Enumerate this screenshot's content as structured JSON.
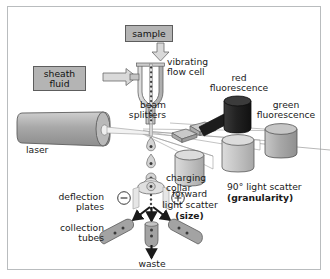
{
  "figure": {
    "type": "flow-cytometer-diagram",
    "background": "#ffffff",
    "frame_color": "#b9bcbe",
    "ink": "#1a1a1a"
  },
  "boxes": {
    "sample": {
      "label": "sample",
      "fill": "#b4b4b4",
      "stroke": "#5d5d5d"
    },
    "sheath_fluid": {
      "label": "sheath\nfluid",
      "fill": "#b4b4b4",
      "stroke": "#5d5d5d"
    }
  },
  "labels": {
    "vibrating_flow_cell": "vibrating\nflow cell",
    "beam_splitters": "beam\nsplitters",
    "red_fluorescence": "red\nfluorescence",
    "green_fluorescence": "green\nfluorescence",
    "laser": "laser",
    "forward_scatter_line1": "forward",
    "forward_scatter_line2": "light scatter",
    "forward_scatter_bold": "(size)",
    "side_scatter_line1": "90° light scatter",
    "side_scatter_bold": "(granularity)",
    "charging_collar": "charging\ncollar",
    "deflection_plates": "deflection\nplates",
    "collection_tubes": "collection\ntubes",
    "waste": "waste",
    "plate_negative": "−",
    "plate_positive": "+"
  },
  "components": {
    "laser_body_fill": "#a6a6a6",
    "detector_fill": "#a9a9a9",
    "detector_fill_light": "#c2c2c2",
    "red_detector_fill": "#262626",
    "flow_cell_fill": "#c9c9c9",
    "splitter_fill": "#bdbdbd",
    "tube_fill": "#9b9b9b",
    "droplet_fill": "#d2d2d2",
    "bench_line": "#8e8e8e"
  }
}
